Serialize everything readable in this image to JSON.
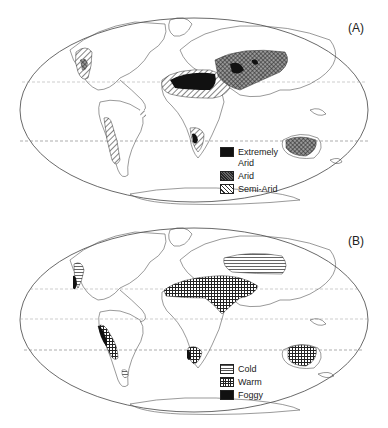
{
  "panels": [
    {
      "id": "A",
      "label": "(A)",
      "legend": [
        {
          "key": "extremely-arid",
          "label": "Extremely\nArid",
          "pattern": "solid-black"
        },
        {
          "key": "arid",
          "label": "Arid",
          "pattern": "crosshatch-dense"
        },
        {
          "key": "semi-arid",
          "label": "Semi-Arid",
          "pattern": "diagonal-hatch"
        }
      ]
    },
    {
      "id": "B",
      "label": "(B)",
      "legend": [
        {
          "key": "cold",
          "label": "Cold",
          "pattern": "horizontal-lines"
        },
        {
          "key": "warm",
          "label": "Warm",
          "pattern": "grid-hatch"
        },
        {
          "key": "foggy",
          "label": "Foggy",
          "pattern": "solid-black"
        }
      ]
    }
  ],
  "colors": {
    "ink": "#111111",
    "outline": "#555555",
    "background": "#ffffff"
  }
}
